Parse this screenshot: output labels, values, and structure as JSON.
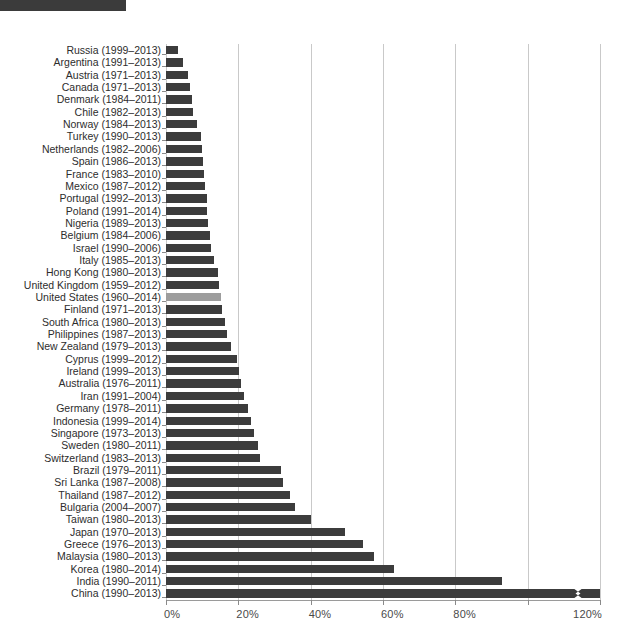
{
  "header": {
    "banner_label": ""
  },
  "chart_data": {
    "type": "bar",
    "orientation": "horizontal",
    "title": "",
    "xlabel": "",
    "ylabel": "",
    "xlim": [
      0,
      120
    ],
    "xtick_values": [
      0,
      20,
      40,
      60,
      80,
      100,
      120
    ],
    "xtick_labels": [
      "0%",
      "20%",
      "40%",
      "60%",
      "80%",
      "",
      "120%"
    ],
    "grid": true,
    "legend": null,
    "highlight_category": "United States (1960–2014)",
    "highlight_color": "#9d9d9d",
    "bar_color": "#3c3c3c",
    "note": "China bar is truncated with an axis-break zigzag mark at the right edge",
    "categories": [
      "Russia  (1999–2013)",
      "Argentina (1991–2013)",
      "Austria (1971–2013)",
      "Canada  (1971–2013)",
      "Denmark (1984–2011)",
      "Chile (1982–2013)",
      "Norway (1984–2013)",
      "Turkey (1990–2013)",
      "Netherlands (1982–2006)",
      "Spain (1986–2013)",
      "France (1983–2010)",
      "Mexico (1987–2012)",
      "Portugal (1992–2013)",
      "Poland (1991–2014)",
      "Nigeria (1989–2013)",
      "Belgium (1984–2006)",
      "Israel (1990–2006)",
      "Italy (1985–2013)",
      "Hong Kong (1980–2013)",
      "United Kingdom (1959–2012)",
      "United States (1960–2014)",
      "Finland (1971–2013)",
      "South Africa (1980–2013)",
      "Philippines (1987–2013)",
      "New Zealand (1979–2013)",
      "Cyprus (1999–2012)",
      "Ireland (1999–2013)",
      "Australia (1976–2011)",
      "Iran (1991–2004)",
      "Germany (1978–2011)",
      "Indonesia (1999–2014)",
      "Singapore (1973–2013)",
      "Sweden (1980–2011)",
      "Switzerland (1983–2013)",
      "Brazil (1979–2011)",
      "Sri Lanka (1987–2008)",
      "Thailand (1987–2012)",
      "Bulgaria (2004–2007)",
      "Taiwan (1980–2013)",
      "Japan (1970–2013)",
      "Greece (1976–2013)",
      "Malaysia (1980–2013)",
      "Korea (1980–2014)",
      "India (1990–2011)",
      "China (1990–2013)"
    ],
    "values": [
      3.4,
      4.6,
      6.2,
      6.6,
      7.3,
      7.4,
      8.6,
      9.6,
      9.9,
      10.3,
      10.5,
      10.8,
      11.2,
      11.4,
      11.6,
      12.1,
      12.5,
      13.4,
      14.3,
      14.6,
      15.1,
      15.6,
      16.2,
      17.0,
      18.0,
      19.6,
      20.2,
      20.6,
      21.7,
      22.6,
      23.6,
      24.4,
      25.3,
      26.0,
      31.8,
      32.4,
      34.4,
      35.8,
      40.0,
      49.5,
      54.6,
      57.5,
      63.0,
      93.0,
      120.0
    ],
    "truncated_flags": [
      false,
      false,
      false,
      false,
      false,
      false,
      false,
      false,
      false,
      false,
      false,
      false,
      false,
      false,
      false,
      false,
      false,
      false,
      false,
      false,
      false,
      false,
      false,
      false,
      false,
      false,
      false,
      false,
      false,
      false,
      false,
      false,
      false,
      false,
      false,
      false,
      false,
      false,
      false,
      false,
      false,
      false,
      false,
      false,
      true
    ]
  }
}
